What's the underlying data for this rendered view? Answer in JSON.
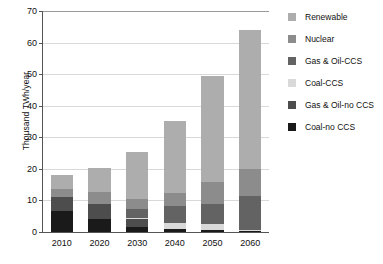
{
  "chart_data": {
    "type": "bar",
    "subtype": "stacked-column",
    "title": "",
    "xlabel": "",
    "ylabel": "Thousand TWh/year",
    "categories": [
      "2010",
      "2020",
      "2030",
      "2040",
      "2050",
      "2060"
    ],
    "ylim": [
      0,
      70
    ],
    "yticks": [
      0,
      10,
      20,
      30,
      40,
      50,
      60,
      70
    ],
    "grid": "horizontal",
    "legend_position": "right",
    "stack_order_bottom_to_top": [
      "Coal-no CCS",
      "Gas & Oil-no CCS",
      "Coal-CCS",
      "Gas & Oil-CCS",
      "Nuclear",
      "Renewable"
    ],
    "series": [
      {
        "name": "Coal-no CCS",
        "color": "#1a1a1a",
        "values": [
          6.5,
          4.0,
          1.5,
          0.8,
          0.7,
          0.6
        ]
      },
      {
        "name": "Gas & Oil-no CCS",
        "color": "#4d4d4d",
        "values": [
          4.5,
          5.0,
          2.7,
          0.0,
          0.0,
          0.0
        ]
      },
      {
        "name": "Coal-CCS",
        "color": "#d9d9d9",
        "values": [
          0.0,
          0.0,
          0.3,
          2.0,
          1.8,
          0.1
        ]
      },
      {
        "name": "Gas & Oil-CCS",
        "color": "#636363",
        "values": [
          0.0,
          0.0,
          2.8,
          5.4,
          6.5,
          10.6
        ]
      },
      {
        "name": "Nuclear",
        "color": "#8c8c8c",
        "values": [
          2.5,
          3.7,
          3.2,
          4.3,
          6.7,
          8.7
        ]
      },
      {
        "name": "Renewable",
        "color": "#adadad",
        "values": [
          4.7,
          7.6,
          15.0,
          22.8,
          33.6,
          44.0
        ]
      }
    ],
    "totals": [
      18.2,
      20.3,
      25.5,
      35.3,
      49.3,
      64.0
    ]
  },
  "legend": {
    "entries": [
      {
        "label": "Renewable",
        "color": "#adadad"
      },
      {
        "label": "Nuclear",
        "color": "#8c8c8c"
      },
      {
        "label": "Gas & Oil-CCS",
        "color": "#636363"
      },
      {
        "label": "Coal-CCS",
        "color": "#d9d9d9"
      },
      {
        "label": "Gas & Oil-no CCS",
        "color": "#4d4d4d"
      },
      {
        "label": "Coal-no CCS",
        "color": "#1a1a1a"
      }
    ]
  }
}
